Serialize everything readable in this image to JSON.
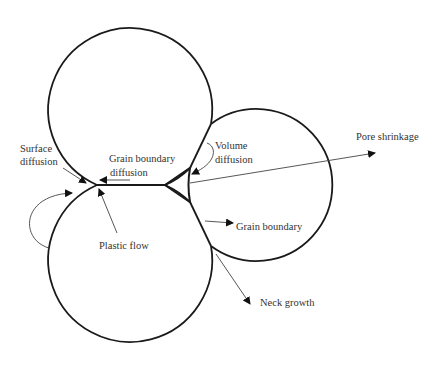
{
  "diagram": {
    "type": "sintering-mechanisms",
    "colors": {
      "line": "#1a1a1a",
      "arrow": "#444444",
      "text": "#333333",
      "background": "#ffffff"
    },
    "particles": [
      {
        "name": "top-particle",
        "cx": 131,
        "cy": 105,
        "r": 82
      },
      {
        "name": "bottom-particle",
        "cx": 131,
        "cy": 263,
        "r": 82
      },
      {
        "name": "right-particle",
        "cx": 280,
        "cy": 200,
        "r": 76
      }
    ],
    "labels": {
      "surface_diffusion_line1": "Surface",
      "surface_diffusion_line2": "diffusion",
      "grain_boundary_diffusion_line1": "Grain boundary",
      "grain_boundary_diffusion_line2": "diffusion",
      "volume_diffusion_line1": "Volume",
      "volume_diffusion_line2": "diffusion",
      "pore_shrinkage": "Pore shrinkage",
      "plastic_flow": "Plastic flow",
      "grain_boundary": "Grain boundary",
      "neck_growth": "Neck growth"
    }
  }
}
